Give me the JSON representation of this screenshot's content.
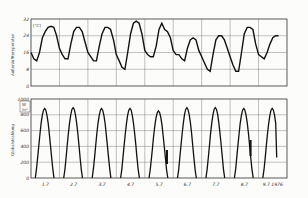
{
  "chart_data": [
    {
      "type": "line",
      "title": "",
      "ylabel": "Außenlufttemperatur",
      "yunit": "[°C]",
      "ylim": [
        0,
        32
      ],
      "yticks": [
        "0",
        "8",
        "16",
        "24",
        "32"
      ],
      "grid": true,
      "x": [
        0,
        0.1,
        0.2,
        0.3,
        0.4,
        0.5,
        0.6,
        0.7,
        0.8,
        0.9,
        1.0,
        1.1,
        1.2,
        1.3,
        1.4,
        1.5,
        1.6,
        1.7,
        1.8,
        1.9,
        2.0,
        2.1,
        2.2,
        2.3,
        2.4,
        2.5,
        2.6,
        2.7,
        2.8,
        2.9,
        3.0,
        3.1,
        3.2,
        3.3,
        3.4,
        3.5,
        3.6,
        3.7,
        3.8,
        3.9,
        4.0,
        4.1,
        4.2,
        4.3,
        4.4,
        4.5,
        4.6,
        4.7,
        4.8,
        4.9,
        5.0,
        5.1,
        5.2,
        5.3,
        5.4,
        5.5,
        5.6,
        5.7,
        5.8,
        5.9,
        6.0,
        6.1,
        6.2,
        6.3,
        6.4,
        6.5,
        6.6,
        6.7,
        6.8,
        6.9,
        7.0,
        7.1,
        7.2,
        7.3,
        7.4,
        7.5,
        7.6,
        7.7,
        7.8,
        7.9,
        8.0,
        8.1,
        8.2,
        8.3,
        8.4,
        8.5,
        8.6,
        8.7
      ],
      "series": [
        {
          "name": "Außenlufttemperatur",
          "values": [
            16,
            13,
            12,
            16,
            23,
            26,
            28,
            28.5,
            28,
            24,
            18,
            15,
            13,
            13,
            20,
            26,
            28,
            28,
            26,
            21,
            16,
            14,
            12,
            12,
            19,
            25,
            28,
            28,
            27,
            22,
            15,
            12,
            9,
            8,
            16,
            25,
            30,
            31,
            30,
            25,
            17,
            15,
            14,
            14,
            19,
            27,
            30,
            27,
            26,
            23,
            17,
            15,
            15,
            13,
            12,
            18,
            22,
            23,
            22,
            17,
            14,
            11,
            8,
            7,
            15,
            22,
            24,
            24,
            22,
            18,
            14,
            10,
            7,
            7,
            16,
            25,
            28,
            28,
            27,
            20,
            15,
            14,
            13,
            16,
            20,
            23,
            24,
            24
          ]
        }
      ]
    },
    {
      "type": "line",
      "title": "",
      "ylabel": "Globalstrahlung",
      "yunit": "[W/m²]",
      "ylim": [
        0,
        1000
      ],
      "yticks": [
        "0",
        "200",
        "400",
        "600",
        "800",
        "1000"
      ],
      "xlabel": "",
      "xticks": [
        "1.7",
        "2.7",
        "3.7",
        "4.7",
        "5.7",
        "6.7",
        "7.7",
        "8.7",
        "9.7 1976"
      ],
      "grid": true,
      "series": [
        {
          "name": "Globalstrahlung",
          "peaks": [
            880,
            890,
            880,
            880,
            850,
            890,
            890,
            880,
            880
          ]
        }
      ]
    }
  ],
  "upper": {
    "yticks": [
      "32",
      "24",
      "16",
      "8",
      "0"
    ],
    "unit": "[°C]",
    "ylabel": "Außenlufttemperatur"
  },
  "lower": {
    "yticks": [
      "1000",
      "800",
      "600",
      "400",
      "200",
      "0"
    ],
    "unit_top": "W",
    "unit_bottom": "m²",
    "ylabel": "Globalstrahlung"
  },
  "xticks": [
    "1.7",
    "2.7",
    "3.7",
    "4.7",
    "5.7",
    "6.7",
    "7.7",
    "8.7",
    "9.7 1976"
  ]
}
